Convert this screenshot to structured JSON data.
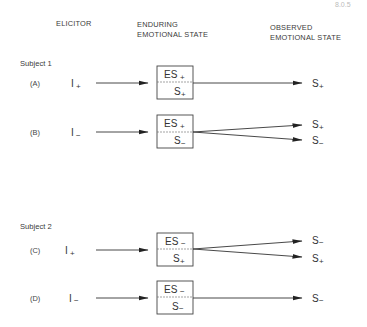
{
  "corner_text": "8.0.5",
  "headers": {
    "elicitor": "ELICITOR",
    "enduring_line1": "ENDURING",
    "enduring_line2": "EMOTIONAL STATE",
    "observed_line1": "OBSERVED",
    "observed_line2": "EMOTIONAL STATE"
  },
  "subjects": [
    {
      "label": "Subject 1",
      "rows": [
        {
          "case": "(A)",
          "elicitor": "I",
          "elicitor_sign": "+",
          "box_top": "ES",
          "box_top_sign": "+",
          "box_bottom": "S",
          "box_bottom_sign": "+",
          "outcomes": [
            {
              "label": "S",
              "sign": "+"
            }
          ]
        },
        {
          "case": "(B)",
          "elicitor": "I",
          "elicitor_sign": "−",
          "box_top": "ES",
          "box_top_sign": "+",
          "box_bottom": "S",
          "box_bottom_sign": "−",
          "outcomes": [
            {
              "label": "S",
              "sign": "+"
            },
            {
              "label": "S",
              "sign": "−"
            }
          ]
        }
      ]
    },
    {
      "label": "Subject 2",
      "rows": [
        {
          "case": "(C)",
          "elicitor": "I",
          "elicitor_sign": "+",
          "box_top": "ES",
          "box_top_sign": "−",
          "box_bottom": "S",
          "box_bottom_sign": "+",
          "outcomes": [
            {
              "label": "S",
              "sign": "−"
            },
            {
              "label": "S",
              "sign": "+"
            }
          ]
        },
        {
          "case": "(D)",
          "elicitor": "I",
          "elicitor_sign": "−",
          "box_top": "ES",
          "box_top_sign": "−",
          "box_bottom": "S",
          "box_bottom_sign": "−",
          "outcomes": [
            {
              "label": "S",
              "sign": "−"
            }
          ]
        }
      ]
    }
  ]
}
